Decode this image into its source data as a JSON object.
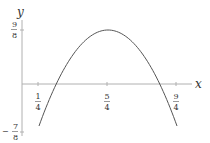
{
  "chart_data": {
    "type": "line",
    "title": "",
    "xlabel": "x",
    "ylabel": "y",
    "function": "y = -2(x - 5/4)^2 + 9/8",
    "series": [
      {
        "name": "parabola",
        "x": [
          0.25,
          0.5,
          0.75,
          1.0,
          1.25,
          1.5,
          1.75,
          2.0,
          2.25
        ],
        "y": [
          -0.875,
          0.0,
          0.625,
          1.0,
          1.125,
          1.0,
          0.625,
          0.0,
          -0.875
        ]
      }
    ],
    "x_ticks": [
      {
        "value": 0.25,
        "num": "1",
        "den": "4"
      },
      {
        "value": 1.25,
        "num": "5",
        "den": "4"
      },
      {
        "value": 2.25,
        "num": "9",
        "den": "4"
      }
    ],
    "y_ticks": [
      {
        "value": 1.125,
        "sign": "",
        "num": "9",
        "den": "8"
      },
      {
        "value": -0.875,
        "sign": "−",
        "num": "7",
        "den": "8"
      }
    ],
    "xlim": [
      0,
      2.6
    ],
    "ylim": [
      -0.9,
      1.4
    ],
    "grid": false,
    "legend": "none",
    "colors": {
      "curve": "#555555",
      "axis": "#aaaaaa",
      "text": "#333333"
    }
  }
}
